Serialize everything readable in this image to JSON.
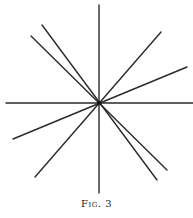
{
  "caption": "Fig. 3",
  "colors": {
    "line": "#2a2a2a",
    "background": "#ffffff"
  },
  "center": {
    "x": 99,
    "y": 103
  },
  "lines": [
    {
      "name": "vertical-line",
      "x1": 99,
      "y1": 5,
      "x2": 99,
      "y2": 193
    },
    {
      "name": "horizontal-line",
      "x1": 6,
      "y1": 103,
      "x2": 193,
      "y2": 103
    },
    {
      "name": "diagonal-line-steep-descending",
      "x1": 42,
      "y1": 25,
      "x2": 157,
      "y2": 180
    },
    {
      "name": "diagonal-line-shallow-descending",
      "x1": 31,
      "y1": 36,
      "x2": 167,
      "y2": 170
    },
    {
      "name": "diagonal-line-steep-ascending",
      "x1": 161,
      "y1": 32,
      "x2": 35,
      "y2": 177
    },
    {
      "name": "diagonal-line-shallow-ascending",
      "x1": 187,
      "y1": 67,
      "x2": 13,
      "y2": 139
    }
  ]
}
